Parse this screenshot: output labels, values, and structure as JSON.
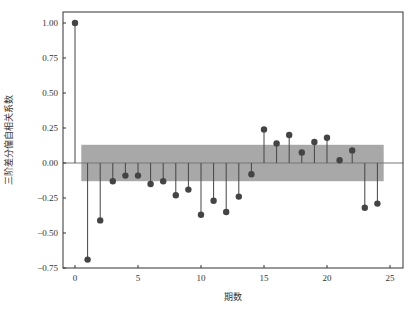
{
  "chart_data": {
    "type": "stem",
    "title": "",
    "xlabel": "期数",
    "ylabel": "三阶差分偏自相关系数",
    "xlim": [
      -1,
      26
    ],
    "ylim": [
      -0.77,
      1.08
    ],
    "xticks": [
      0,
      5,
      10,
      15,
      20,
      25
    ],
    "xtick_labels": [
      "0",
      "5",
      "10",
      "15",
      "20",
      "25"
    ],
    "yticks": [
      1.0,
      0.75,
      0.5,
      0.25,
      0.0,
      -0.25,
      -0.5,
      -0.75
    ],
    "ytick_labels": [
      "1.00",
      "0.75",
      "0.50",
      "0.25",
      "0.00",
      "−0.25",
      "−0.50",
      "−0.75"
    ],
    "grid": false,
    "legend": null,
    "confidence_band": {
      "lower": -0.13,
      "upper": 0.13,
      "x_start": 0.5,
      "x_end": 24.5,
      "color": "#999999"
    },
    "zero_line": true,
    "series": [
      {
        "name": "PACF",
        "x": [
          0,
          1,
          2,
          3,
          4,
          5,
          6,
          7,
          8,
          9,
          10,
          11,
          12,
          13,
          14,
          15,
          16,
          17,
          18,
          19,
          20,
          21,
          22,
          23,
          24
        ],
        "values": [
          1.0,
          -0.69,
          -0.41,
          -0.13,
          -0.09,
          -0.09,
          -0.15,
          -0.13,
          -0.23,
          -0.19,
          -0.37,
          -0.27,
          -0.35,
          -0.24,
          -0.08,
          0.24,
          0.14,
          0.2,
          0.075,
          0.15,
          0.18,
          0.02,
          0.09,
          -0.32,
          -0.29
        ],
        "color": "#444444"
      }
    ]
  }
}
